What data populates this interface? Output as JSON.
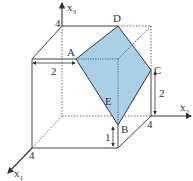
{
  "diagram": {
    "type": "3d-coordinate-cube-with-plane-section",
    "colors": {
      "face_fill": "#a9d0e6",
      "edge": "#444444",
      "dotted": "#555555"
    },
    "axes": {
      "x1": {
        "label": "x",
        "sub": "1"
      },
      "x2": {
        "label": "x",
        "sub": "2"
      },
      "x3": {
        "label": "x",
        "sub": "3"
      }
    },
    "points": {
      "A": "A",
      "B": "B",
      "C": "C",
      "D": "D",
      "E": "E"
    },
    "ticks": {
      "x3_top": "4",
      "x2_end": "4",
      "x1_end": "4"
    },
    "dimensions": {
      "front_top_to_A": "2",
      "C_height": "2",
      "B_height": "1"
    }
  }
}
